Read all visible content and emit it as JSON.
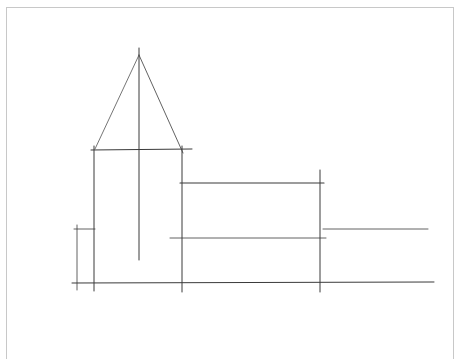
{
  "drawing": {
    "subject": "pencil sketch of church with spire tower and nave",
    "stroke_color": "#3a3a3a",
    "frame_color": "#c8c8c8",
    "lines": [
      {
        "name": "spire-left-edge",
        "x1": 139,
        "y1": 55,
        "x2": 95,
        "y2": 149,
        "w": 0.7
      },
      {
        "name": "spire-right-edge",
        "x1": 139,
        "y1": 55,
        "x2": 183,
        "y2": 153,
        "w": 0.8
      },
      {
        "name": "spire-center-axis",
        "x1": 139,
        "y1": 48,
        "x2": 139,
        "y2": 260,
        "w": 1
      },
      {
        "name": "tower-top",
        "x1": 91,
        "y1": 150,
        "x2": 192,
        "y2": 149,
        "w": 1
      },
      {
        "name": "tower-left-wall",
        "x1": 94,
        "y1": 146,
        "x2": 94,
        "y2": 291,
        "w": 1
      },
      {
        "name": "tower-right-wall",
        "x1": 182,
        "y1": 146,
        "x2": 182,
        "y2": 292,
        "w": 1
      },
      {
        "name": "nave-top",
        "x1": 180,
        "y1": 183,
        "x2": 324,
        "y2": 183,
        "w": 1.1
      },
      {
        "name": "nave-right-wall",
        "x1": 320,
        "y1": 170,
        "x2": 320,
        "y2": 292,
        "w": 1
      },
      {
        "name": "nave-mid-line",
        "x1": 170,
        "y1": 238,
        "x2": 326,
        "y2": 238,
        "w": 0.8
      },
      {
        "name": "annex-line",
        "x1": 323,
        "y1": 229,
        "x2": 428,
        "y2": 229,
        "w": 0.8
      },
      {
        "name": "ground-line",
        "x1": 72,
        "y1": 283,
        "x2": 434,
        "y2": 282,
        "w": 1
      },
      {
        "name": "side-marker-vertical",
        "x1": 77,
        "y1": 225,
        "x2": 77,
        "y2": 290,
        "w": 0.8
      },
      {
        "name": "side-marker-horizontal",
        "x1": 74,
        "y1": 229,
        "x2": 95,
        "y2": 229,
        "w": 0.8
      }
    ]
  }
}
